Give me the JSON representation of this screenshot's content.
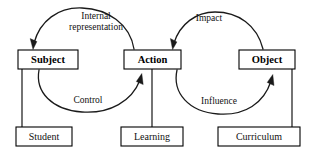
{
  "diagram": {
    "type": "activity-system-cycle-diagram",
    "background_color": "#ffffff",
    "stroke_color": "#000000",
    "width": 315,
    "height": 152,
    "nodes": {
      "subject": {
        "label": "Subject",
        "x": 18,
        "y": 50,
        "w": 60,
        "h": 19
      },
      "action": {
        "label": "Action",
        "x": 124,
        "y": 50,
        "w": 57,
        "h": 19
      },
      "object": {
        "label": "Object",
        "x": 239,
        "y": 50,
        "w": 56,
        "h": 19
      },
      "student": {
        "label": "Student",
        "x": 16,
        "y": 127,
        "w": 56,
        "h": 19
      },
      "learning": {
        "label": "Learning",
        "x": 121,
        "y": 127,
        "w": 62,
        "h": 19
      },
      "curriculum": {
        "label": "Curriculum",
        "x": 218,
        "y": 127,
        "w": 82,
        "h": 19
      }
    },
    "edges": {
      "internal_representation": {
        "label_line1": "Internal",
        "label_line2": "representation",
        "from": "action",
        "to": "subject",
        "direction": "right-to-left",
        "position": "above"
      },
      "impact": {
        "label_line1": "Impact",
        "label_line2": "",
        "from": "object",
        "to": "action",
        "direction": "right-to-left",
        "position": "above"
      },
      "control": {
        "label_line1": "Control",
        "label_line2": "",
        "from": "subject",
        "to": "action",
        "direction": "left-to-right",
        "position": "below"
      },
      "influence": {
        "label_line1": "Influence",
        "label_line2": "",
        "from": "learning",
        "to": "object",
        "direction": "left-to-right",
        "position": "below"
      }
    },
    "connectors": [
      {
        "name": "subject-to-student",
        "x": 22,
        "y1": 69,
        "y2": 127
      },
      {
        "name": "action-to-learning",
        "x": 152,
        "y1": 69,
        "y2": 127
      },
      {
        "name": "object-to-curriculum",
        "x": 292,
        "y1": 69,
        "y2": 127
      }
    ]
  }
}
